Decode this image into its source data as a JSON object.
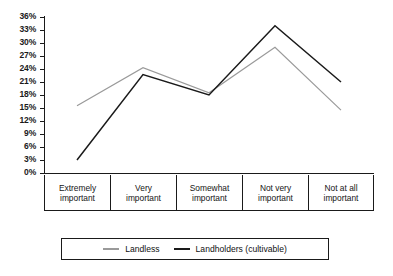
{
  "chart_data": {
    "type": "line",
    "title": "",
    "xlabel": "",
    "ylabel": "",
    "ylim": [
      0,
      36
    ],
    "yticks": [
      "0%",
      "3%",
      "6%",
      "9%",
      "12%",
      "15%",
      "18%",
      "21%",
      "24%",
      "27%",
      "30%",
      "33%",
      "36%"
    ],
    "grid": false,
    "legend_position": "bottom",
    "categories": [
      "Extremely important",
      "Very important",
      "Somewhat important",
      "Not very important",
      "Not at all important"
    ],
    "series": [
      {
        "name": "Landless",
        "color": "#9a9a9a",
        "values": [
          15.5,
          24.3,
          18.5,
          29.0,
          14.5
        ]
      },
      {
        "name": "Landholders (cultivable)",
        "color": "#1a1a1a",
        "values": [
          3.0,
          22.7,
          18.0,
          34.0,
          21.0
        ]
      }
    ]
  },
  "categories_wrapped": [
    {
      "line1": "Extremely",
      "line2": "important"
    },
    {
      "line1": "Very",
      "line2": "important"
    },
    {
      "line1": "Somewhat",
      "line2": "important"
    },
    {
      "line1": "Not very",
      "line2": "important"
    },
    {
      "line1": "Not at all",
      "line2": "important"
    }
  ],
  "legend": {
    "items": [
      {
        "label": "Landless",
        "color": "#9a9a9a"
      },
      {
        "label": "Landholders (cultivable)",
        "color": "#1a1a1a"
      }
    ]
  }
}
